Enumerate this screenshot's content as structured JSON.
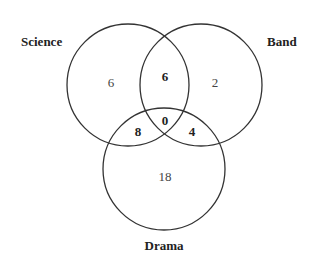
{
  "diagram": {
    "type": "venn-3",
    "sets": [
      {
        "name": "Science",
        "circle": {
          "cx": 128,
          "cy": 85,
          "r": 61
        }
      },
      {
        "name": "Band",
        "circle": {
          "cx": 201,
          "cy": 85,
          "r": 61
        }
      },
      {
        "name": "Drama",
        "circle": {
          "cx": 164,
          "cy": 169,
          "r": 61
        }
      }
    ],
    "labels": {
      "science": "Science",
      "band": "Band",
      "drama": "Drama"
    },
    "regions": {
      "science_only": "6",
      "band_only": "2",
      "drama_only": "18",
      "science_band": "6",
      "science_drama": "8",
      "band_drama": "4",
      "all_three": "0"
    }
  }
}
